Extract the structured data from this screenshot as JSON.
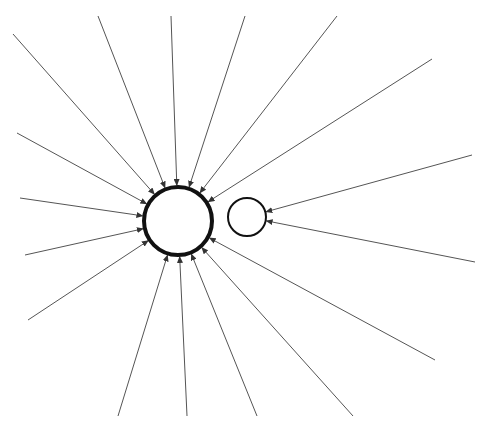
{
  "diagram": {
    "type": "radial-convergence",
    "line_color": "#555555",
    "circle_color": "#111111",
    "background": "#ffffff",
    "hub": {
      "cx": 178,
      "cy": 221,
      "r": 34,
      "stroke_width": 4
    },
    "satellite": {
      "cx": 247,
      "cy": 217,
      "r": 19,
      "stroke_width": 2
    },
    "arrows_to_hub": [
      [
        13,
        34
      ],
      [
        98,
        16
      ],
      [
        171,
        16
      ],
      [
        245,
        16
      ],
      [
        337,
        16
      ],
      [
        432,
        59
      ],
      [
        17,
        133
      ],
      [
        20,
        198
      ],
      [
        25,
        255
      ],
      [
        28,
        320
      ],
      [
        118,
        416
      ],
      [
        187,
        416
      ],
      [
        257,
        416
      ],
      [
        353,
        416
      ],
      [
        435,
        360
      ]
    ],
    "arrows_to_satellite": [
      [
        472,
        155
      ],
      [
        475,
        262
      ]
    ]
  }
}
